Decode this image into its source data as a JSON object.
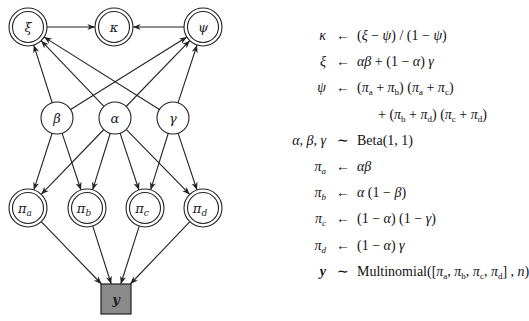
{
  "graph": {
    "nodes": [
      {
        "id": "xi",
        "label": "ξ",
        "type": "deterministic",
        "x": 28,
        "y": 27
      },
      {
        "id": "kappa",
        "label": "κ",
        "type": "deterministic",
        "x": 114,
        "y": 27
      },
      {
        "id": "psi",
        "label": "ψ",
        "type": "deterministic",
        "x": 203,
        "y": 27
      },
      {
        "id": "beta",
        "label": "β",
        "type": "stochastic",
        "x": 57,
        "y": 118
      },
      {
        "id": "alpha",
        "label": "α",
        "type": "stochastic",
        "x": 115,
        "y": 118
      },
      {
        "id": "gamma",
        "label": "γ",
        "type": "stochastic",
        "x": 173,
        "y": 118
      },
      {
        "id": "pi_a",
        "label": "π",
        "sub": "a",
        "type": "deterministic",
        "x": 28,
        "y": 208
      },
      {
        "id": "pi_b",
        "label": "π",
        "sub": "b",
        "type": "deterministic",
        "x": 87,
        "y": 208
      },
      {
        "id": "pi_c",
        "label": "π",
        "sub": "c",
        "type": "deterministic",
        "x": 145,
        "y": 208
      },
      {
        "id": "pi_d",
        "label": "π",
        "sub": "d",
        "type": "deterministic",
        "x": 203,
        "y": 208
      },
      {
        "id": "y",
        "label": "y",
        "type": "observed",
        "x": 116,
        "y": 299
      }
    ],
    "edges": [
      [
        "xi",
        "kappa"
      ],
      [
        "psi",
        "kappa"
      ],
      [
        "beta",
        "xi"
      ],
      [
        "alpha",
        "xi"
      ],
      [
        "gamma",
        "xi"
      ],
      [
        "beta",
        "psi"
      ],
      [
        "alpha",
        "psi"
      ],
      [
        "gamma",
        "psi"
      ],
      [
        "beta",
        "pi_a"
      ],
      [
        "beta",
        "pi_b"
      ],
      [
        "alpha",
        "pi_a"
      ],
      [
        "alpha",
        "pi_b"
      ],
      [
        "alpha",
        "pi_c"
      ],
      [
        "alpha",
        "pi_d"
      ],
      [
        "gamma",
        "pi_c"
      ],
      [
        "gamma",
        "pi_d"
      ],
      [
        "pi_a",
        "y"
      ],
      [
        "pi_b",
        "y"
      ],
      [
        "pi_c",
        "y"
      ],
      [
        "pi_d",
        "y"
      ]
    ],
    "colors": {
      "stroke": "#222222",
      "observed_fill": "#8a8a8a",
      "node_fill": "#ffffff"
    }
  },
  "equations": [
    {
      "lhs": "κ",
      "op": "←",
      "rhs": "(ξ − ψ) / (1 − ψ)"
    },
    {
      "lhs": "ξ",
      "op": "←",
      "rhs": "αβ + (1 − α) γ"
    },
    {
      "lhs": "ψ",
      "op": "←",
      "rhs": "(πₐ + π_b) (πₐ + π_c)"
    },
    {
      "lhs": "",
      "op": "",
      "rhs": "+ (π_b + π_d) (π_c + π_d)"
    },
    {
      "lhs": "α, β, γ",
      "op": "∼",
      "rhs": "Beta(1, 1)"
    },
    {
      "lhs": "πₐ",
      "op": "←",
      "rhs": "αβ"
    },
    {
      "lhs": "π_b",
      "op": "←",
      "rhs": "α (1 − β)"
    },
    {
      "lhs": "π_c",
      "op": "←",
      "rhs": "(1 − α) (1 − γ)"
    },
    {
      "lhs": "π_d",
      "op": "←",
      "rhs": "(1 − α) γ"
    },
    {
      "lhs": "y",
      "op": "∼",
      "rhs": "Multinomial([πₐ, π_b, π_c, π_d] , n)"
    }
  ]
}
